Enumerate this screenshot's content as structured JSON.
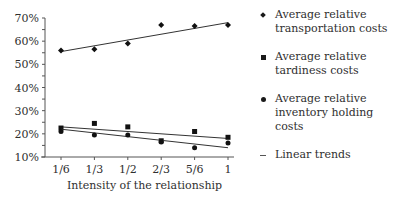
{
  "chart_data": {
    "type": "scatter",
    "title": "",
    "xlabel": "Intensity of the relationship",
    "ylabel": "",
    "categories": [
      "1/6",
      "1/3",
      "1/2",
      "2/3",
      "5/6",
      "1"
    ],
    "x": [
      0.1667,
      0.3333,
      0.5,
      0.6667,
      0.8333,
      1.0
    ],
    "y_ticks": [
      "10%",
      "20%",
      "30%",
      "40%",
      "50%",
      "60%",
      "70%"
    ],
    "ylim": [
      10,
      70
    ],
    "grid": false,
    "legend_position": "right",
    "series": [
      {
        "name": "Average relative transportation costs",
        "marker": "diamond",
        "values": [
          56,
          56.5,
          59,
          67,
          66.5,
          67
        ],
        "trend": [
          55.5,
          68
        ]
      },
      {
        "name": "Average relative tardiness costs",
        "marker": "square",
        "values": [
          22.5,
          24.5,
          23,
          17,
          21,
          18.5
        ],
        "trend": [
          23,
          18
        ]
      },
      {
        "name": "Average relative inventory holding costs",
        "marker": "dot",
        "values": [
          21,
          19.5,
          19.5,
          16.5,
          14,
          16
        ],
        "trend": [
          22,
          14
        ]
      }
    ],
    "trend_label": "Linear trends"
  },
  "legend": {
    "items": [
      {
        "line1": "Average relative",
        "line2": "transportation costs"
      },
      {
        "line1": "Average relative",
        "line2": "tardiness costs"
      },
      {
        "line1": "Average relative",
        "line2": "inventory holding costs"
      },
      {
        "line1": "Linear trends",
        "line2": ""
      }
    ]
  }
}
